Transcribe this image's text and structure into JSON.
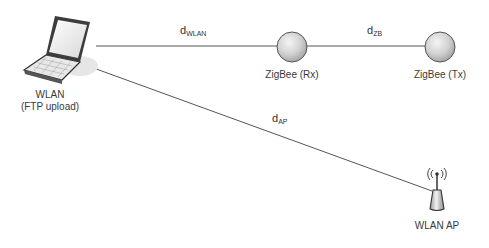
{
  "nodes": {
    "laptop": {
      "label_line1": "WLAN",
      "label_line2": "(FTP upload)",
      "icon": "laptop-icon"
    },
    "zigbee_rx": {
      "label": "ZigBee (Rx)",
      "icon": "circle-node-icon"
    },
    "zigbee_tx": {
      "label": "ZigBee (Tx)",
      "icon": "circle-node-icon"
    },
    "wlan_ap": {
      "label": "WLAN AP",
      "icon": "wifi-access-point-icon"
    }
  },
  "links": {
    "wlan": {
      "base": "d",
      "sub": "WLAN"
    },
    "zb": {
      "base": "d",
      "sub": "ZB"
    },
    "ap": {
      "base": "d",
      "sub": "AP"
    }
  },
  "colors": {
    "line": "#555555",
    "node_fill": "#cfcfcf",
    "node_stroke": "#555555"
  }
}
